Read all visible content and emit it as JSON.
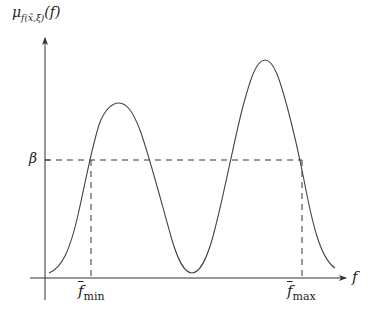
{
  "diagram": {
    "y_axis_label": {
      "mu": "μ",
      "sub": "f(x̃,ξ)",
      "arg": "(f)"
    },
    "x_axis_label": "f",
    "threshold_label": "β",
    "f_min_label": {
      "base": "f",
      "sub": "min"
    },
    "f_max_label": {
      "base": "f",
      "sub": "max"
    },
    "colors": {
      "axis": "#333333",
      "curve": "#444444",
      "dashed": "#333333"
    },
    "curve_description": "Membership function with two peaks; second peak higher than first; trough near zero between them",
    "geometry": {
      "origin": [
        45,
        278
      ],
      "beta_y": 160,
      "f_min_x": 91,
      "f_max_x": 302,
      "peak1": [
        119,
        103
      ],
      "trough": [
        192,
        273
      ],
      "peak2": [
        265,
        60
      ]
    }
  }
}
